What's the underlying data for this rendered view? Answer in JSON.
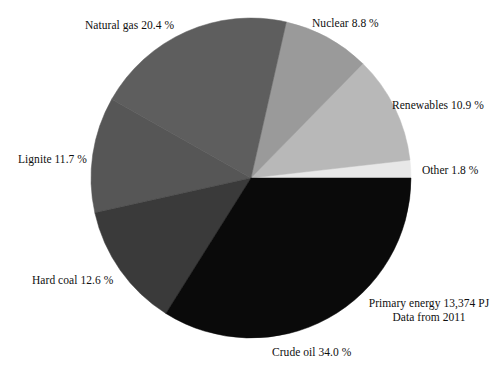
{
  "chart_data": {
    "type": "pie",
    "title": "",
    "subtitle": "",
    "xlabel": "",
    "ylabel": "",
    "legend_position": "none",
    "grid": false,
    "units": "%",
    "total_label": "Primary energy 13,374 PJ",
    "source_label": "Data from 2011",
    "total_value": 13374,
    "total_unit": "PJ",
    "data_year": 2011,
    "start_angle_deg": 0,
    "direction": "counterclockwise",
    "categories": [
      "Other",
      "Renewables",
      "Nuclear",
      "Natural gas",
      "Lignite",
      "Hard coal",
      "Crude oil"
    ],
    "values": [
      1.8,
      10.9,
      8.8,
      20.4,
      11.7,
      12.6,
      34.0
    ],
    "colors": [
      "#e8e8e8",
      "#b8b8b8",
      "#9a9a9a",
      "#5e5e5e",
      "#565656",
      "#3a3a3a",
      "#0a0a0a"
    ],
    "slices": [
      {
        "name": "Other",
        "value": 1.8,
        "label": "Other 1.8 %",
        "color": "#e8e8e8"
      },
      {
        "name": "Renewables",
        "value": 10.9,
        "label": "Renewables 10.9 %",
        "color": "#b8b8b8"
      },
      {
        "name": "Nuclear",
        "value": 8.8,
        "label": "Nuclear 8.8 %",
        "color": "#9a9a9a"
      },
      {
        "name": "Natural gas",
        "value": 20.4,
        "label": "Natural gas 20.4 %",
        "color": "#5e5e5e"
      },
      {
        "name": "Lignite",
        "value": 11.7,
        "label": "Lignite 11.7 %",
        "color": "#565656"
      },
      {
        "name": "Hard coal",
        "value": 12.6,
        "label": "Hard coal 12.6 %",
        "color": "#3a3a3a"
      },
      {
        "name": "Crude oil",
        "value": 34.0,
        "label": "Crude oil 34.0 %",
        "color": "#0a0a0a"
      }
    ]
  },
  "labels": {
    "natural_gas": "Natural gas 20.4 %",
    "nuclear": "Nuclear 8.8 %",
    "renewables": "Renewables 10.9 %",
    "other": "Other 1.8 %",
    "lignite": "Lignite 11.7 %",
    "hard_coal": "Hard coal 12.6 %",
    "crude_oil": "Crude oil 34.0 %"
  },
  "annotation": {
    "line1": "Primary energy 13,374 PJ",
    "line2": "Data from 2011"
  },
  "geometry": {
    "center_x": 251,
    "center_y": 178,
    "radius": 160
  }
}
